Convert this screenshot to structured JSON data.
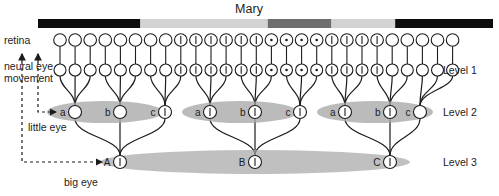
{
  "title": "Mary",
  "labels": {
    "retina": "retina",
    "neural_eye_movement_line1": "neural eye",
    "neural_eye_movement_line2": "movement",
    "little_eye": "little eye",
    "big_eye": "big eye",
    "level1": "Level 1",
    "level2": "Level 2",
    "level3": "Level 3"
  },
  "colors": {
    "stroke": "#1c1c1c",
    "node_fill": "#ffffff",
    "ellipse_fill": "#a8a8a8",
    "ellipse_fill_light": "#bdbdbd",
    "bar_dark": "#0d0d0d",
    "bar_mid": "#6e6e6e",
    "bar_light": "#d3d3d3",
    "text": "#1c1c1c"
  },
  "stimulus_bar": {
    "x": 38,
    "y": 19,
    "width": 455,
    "height": 9,
    "segments": [
      {
        "name": "black-left",
        "start": 0.0,
        "end": 0.225,
        "color": "#0d0d0d"
      },
      {
        "name": "light-gray-1",
        "start": 0.225,
        "end": 0.505,
        "color": "#d3d3d3"
      },
      {
        "name": "mid-gray",
        "start": 0.505,
        "end": 0.645,
        "color": "#6e6e6e"
      },
      {
        "name": "light-gray-2",
        "start": 0.645,
        "end": 0.785,
        "color": "#d3d3d3"
      },
      {
        "name": "black-right",
        "start": 0.785,
        "end": 1.0,
        "color": "#0d0d0d"
      }
    ]
  },
  "rows": {
    "retina_y": 40,
    "level1_y": 70,
    "level2_y": 112,
    "level3_y": 162
  },
  "retina": {
    "count": 27,
    "x_start": 60,
    "x_step": 15.1,
    "radius": 6.3,
    "marked_indices": [
      8,
      9,
      10,
      11,
      12,
      13,
      14,
      15,
      16,
      17,
      18,
      19,
      20,
      21
    ],
    "dot_indices": [
      14,
      15,
      16,
      17
    ]
  },
  "level1": {
    "count": 27,
    "x_start": 60,
    "x_step": 15.1,
    "radius": 6.0,
    "marked_indices": [
      8,
      9,
      10,
      11,
      12,
      13,
      14,
      15,
      16,
      17,
      18,
      19,
      20,
      21
    ],
    "dot_indices": [
      14,
      15,
      16,
      17
    ]
  },
  "level2": {
    "radius": 6.5,
    "groups": [
      {
        "name": "group-1",
        "ellipse": {
          "cx": 105,
          "cy": 112,
          "rx": 58,
          "ry": 11
        },
        "nodes": [
          {
            "label": "a",
            "cx": 75,
            "marked": false
          },
          {
            "label": "b",
            "cx": 120,
            "marked": false
          },
          {
            "label": "c",
            "cx": 165,
            "marked": true
          }
        ]
      },
      {
        "name": "group-2",
        "ellipse": {
          "cx": 240,
          "cy": 112,
          "rx": 58,
          "ry": 11
        },
        "nodes": [
          {
            "label": "a",
            "cx": 210,
            "marked": true
          },
          {
            "label": "b",
            "cx": 255,
            "marked": true
          },
          {
            "label": "c",
            "cx": 300,
            "marked": true
          }
        ]
      },
      {
        "name": "group-3",
        "ellipse": {
          "cx": 375,
          "cy": 112,
          "rx": 58,
          "ry": 11
        },
        "nodes": [
          {
            "label": "a",
            "cx": 345,
            "marked": true
          },
          {
            "label": "b",
            "cx": 390,
            "marked": true
          },
          {
            "label": "c",
            "cx": 420,
            "marked": false
          }
        ]
      }
    ]
  },
  "level3": {
    "ellipse": {
      "cx": 255,
      "cy": 162,
      "rx": 155,
      "ry": 12
    },
    "radius": 6.5,
    "nodes": [
      {
        "label": "A",
        "cx": 120,
        "marked": true
      },
      {
        "label": "B",
        "cx": 255,
        "marked": true
      },
      {
        "label": "C",
        "cx": 390,
        "marked": true
      }
    ]
  },
  "eye_arrows": {
    "big_eye": {
      "x": 22,
      "y_top": 70,
      "y_bottom": 162,
      "x_end": 110
    },
    "little_eye": {
      "x": 38,
      "y_top": 70,
      "y_bottom": 112,
      "x_end": 64
    }
  }
}
